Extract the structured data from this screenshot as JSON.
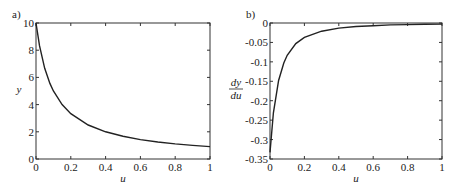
{
  "chart_data": [
    {
      "type": "line",
      "panel_label": "a)",
      "title": "",
      "xlabel": "u",
      "ylabel": "y",
      "xlim": [
        0,
        1
      ],
      "ylim": [
        0,
        10
      ],
      "xticks": [
        "0",
        "0.2",
        "0.4",
        "0.6",
        "0.8",
        "1"
      ],
      "yticks": [
        "0",
        "2",
        "4",
        "6",
        "8",
        "10"
      ],
      "grid": false,
      "series": [
        {
          "name": "y",
          "x": [
            0,
            0.02,
            0.05,
            0.08,
            0.1,
            0.15,
            0.2,
            0.3,
            0.4,
            0.5,
            0.6,
            0.7,
            0.8,
            0.9,
            1.0
          ],
          "y": [
            10,
            8.33,
            6.67,
            5.56,
            5.0,
            4.0,
            3.33,
            2.5,
            2.0,
            1.67,
            1.43,
            1.25,
            1.11,
            1.0,
            0.91
          ]
        }
      ]
    },
    {
      "type": "line",
      "panel_label": "b)",
      "title": "",
      "xlabel": "u",
      "ylabel_num": "dy",
      "ylabel_den": "du",
      "xlim": [
        0,
        1
      ],
      "ylim": [
        -0.35,
        0
      ],
      "xticks": [
        "0",
        "0.2",
        "0.4",
        "0.6",
        "0.8",
        "1"
      ],
      "yticks": [
        "0",
        "-0.05",
        "-0.1",
        "-0.15",
        "-0.2",
        "-0.25",
        "-0.3",
        "-0.35"
      ],
      "grid": false,
      "series": [
        {
          "name": "dy/du",
          "x": [
            0,
            0.02,
            0.05,
            0.08,
            0.1,
            0.15,
            0.2,
            0.3,
            0.4,
            0.5,
            0.6,
            0.7,
            0.8,
            0.9,
            1.0
          ],
          "y": [
            -0.333,
            -0.231,
            -0.148,
            -0.103,
            -0.083,
            -0.053,
            -0.037,
            -0.021,
            -0.013,
            -0.009,
            -0.007,
            -0.005,
            -0.004,
            -0.0033,
            -0.0028
          ]
        }
      ]
    }
  ]
}
